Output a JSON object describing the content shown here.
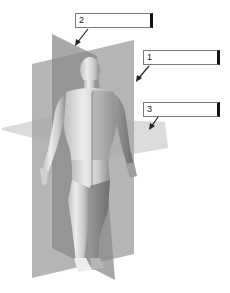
{
  "diagram": {
    "planes": [
      {
        "id": "frontal",
        "label_number": "1",
        "color": "#9e9e9e"
      },
      {
        "id": "sagittal",
        "label_number": "2",
        "color": "#8a8a8a"
      },
      {
        "id": "transverse",
        "label_number": "3",
        "color": "#c8c8c8"
      }
    ],
    "labels": [
      {
        "number": "1",
        "value": ""
      },
      {
        "number": "2",
        "value": ""
      },
      {
        "number": "3",
        "value": ""
      }
    ],
    "colors": {
      "background": "#ffffff",
      "label_border": "#7a7a7a",
      "label_right_edge": "#111111",
      "arrow": "#222222",
      "skin_light": "#e6e6e6",
      "skin_shadow": "#9a9a9a"
    }
  }
}
